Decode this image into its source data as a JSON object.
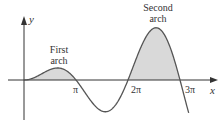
{
  "chart_data": {
    "type": "line",
    "title": "",
    "function": "y = x sin x",
    "xlabel": "x",
    "ylabel": "y",
    "x_ticks": [
      {
        "value": 3.14159,
        "label": "π"
      },
      {
        "value": 6.28319,
        "label": "2π"
      },
      {
        "value": 9.42478,
        "label": "3π"
      }
    ],
    "xlim": [
      -0.4,
      9.8
    ],
    "ylim": [
      -6.5,
      9.5
    ],
    "grid": false,
    "shaded_regions": [
      {
        "name": "First arch",
        "from": 0,
        "to": 3.14159
      },
      {
        "name": "Second arch",
        "from": 6.28319,
        "to": 9.42478
      }
    ],
    "key_points": [
      {
        "x": 2.03,
        "y": 1.82,
        "note": "first arch max"
      },
      {
        "x": 4.91,
        "y": -4.81,
        "note": "trough"
      },
      {
        "x": 7.98,
        "y": 7.92,
        "note": "second arch max"
      }
    ],
    "annotations": [
      "First arch",
      "Second arch"
    ],
    "colors": {
      "curve": "#555555",
      "shade": "#d9d9d9",
      "axis": "#333333"
    }
  },
  "labels": {
    "y_axis": "y",
    "x_axis": "x",
    "pi": "π",
    "two_pi": "2π",
    "three_pi": "3π",
    "first_arch_line1": "First",
    "first_arch_line2": "arch",
    "second_arch_line1": "Second",
    "second_arch_line2": "arch"
  }
}
